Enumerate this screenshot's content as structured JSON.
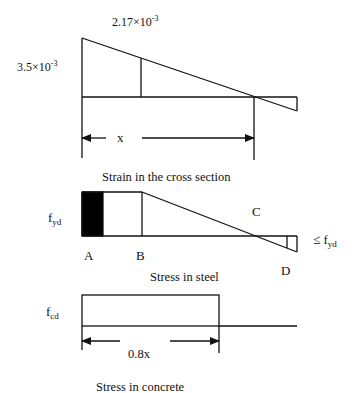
{
  "strain_diagram": {
    "top_label": "2.17×10",
    "top_label_exp": "-3",
    "left_label": "3.5×10",
    "left_label_exp": "-3",
    "dimension_label": "x",
    "caption": "Strain in the cross section"
  },
  "steel_diagram": {
    "left_label_main": "f",
    "left_label_sub": "yd",
    "point_a": "A",
    "point_b": "B",
    "point_c": "C",
    "point_d": "D",
    "right_label_main": "≤ f",
    "right_label_sub": "yd",
    "caption": "Stress in steel"
  },
  "concrete_diagram": {
    "left_label_main": "f",
    "left_label_sub": "cd",
    "dimension_label": "0.8x",
    "caption": "Stress in concrete"
  },
  "colors": {
    "line": "#111111",
    "fill": "#000000",
    "background": "#ffffff"
  }
}
